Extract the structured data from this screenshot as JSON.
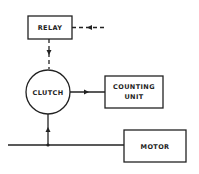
{
  "diagram": {
    "nodes": {
      "relay": {
        "label": "RELAY"
      },
      "clutch": {
        "label": "CLUTCH"
      },
      "counting_unit": {
        "label_line1": "COUNTING",
        "label_line2": "UNIT"
      },
      "motor": {
        "label": "MOTOR"
      }
    },
    "edges": [
      {
        "from": "external",
        "to": "relay",
        "style": "dashed"
      },
      {
        "from": "relay",
        "to": "clutch",
        "style": "dashed"
      },
      {
        "from": "clutch",
        "to": "counting_unit",
        "style": "solid"
      },
      {
        "from": "motor",
        "to": "clutch",
        "style": "solid"
      }
    ],
    "colors": {
      "stroke": "#222222",
      "background": "#ffffff"
    }
  }
}
